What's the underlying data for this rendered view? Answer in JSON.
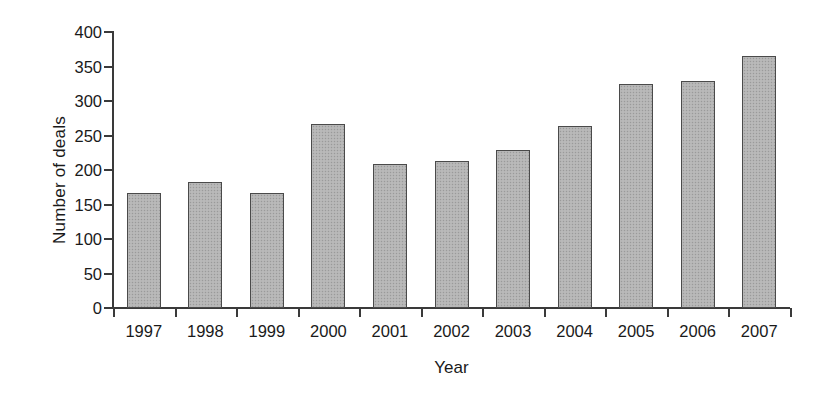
{
  "chart_data": {
    "type": "bar",
    "title": "",
    "subtitle": "",
    "xlabel": "Year",
    "ylabel": "Number of deals",
    "categories": [
      "1997",
      "1998",
      "1999",
      "2000",
      "2001",
      "2002",
      "2003",
      "2004",
      "2005",
      "2006",
      "2007"
    ],
    "values": [
      166,
      183,
      167,
      267,
      209,
      213,
      229,
      264,
      325,
      329,
      365
    ],
    "ylim": [
      0,
      400
    ],
    "yticks": [
      0,
      50,
      100,
      150,
      200,
      250,
      300,
      350,
      400
    ],
    "ytick_labels": [
      "0",
      "50",
      "100",
      "150",
      "200",
      "250",
      "300",
      "350",
      "400"
    ],
    "grid": false,
    "legend": null,
    "legend_position": "none",
    "bar_fill_color": "#b4b4b4",
    "bar_edge_color": "#4a4a4a",
    "axis_color": "#3a3a3a",
    "background_color": "#ffffff"
  }
}
